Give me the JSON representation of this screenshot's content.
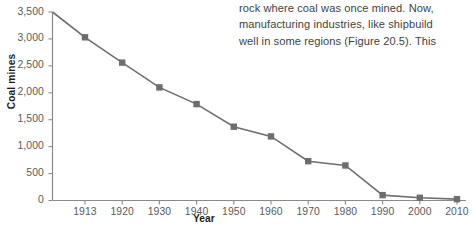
{
  "passage": {
    "lines": [
      "rock where coal was once mined. Now,",
      "manufacturing industries, like shipbuild",
      "well in some regions (Figure 20.5). This"
    ]
  },
  "chart_data": {
    "type": "line",
    "title": "",
    "xlabel": "Year",
    "ylabel": "Coal mines",
    "categories": [
      "1913",
      "1920",
      "1930",
      "1940",
      "1950",
      "1960",
      "1970",
      "1980",
      "1990",
      "2000",
      "2010"
    ],
    "values": [
      3030,
      2560,
      2100,
      1790,
      1370,
      1190,
      730,
      650,
      100,
      50,
      25
    ],
    "axis_origin_value": 3500,
    "ylim": [
      0,
      3500
    ],
    "yticks": [
      "0",
      "500",
      "1,000",
      "1,500",
      "2,000",
      "2,500",
      "3,000",
      "3,500"
    ],
    "ytick_values": [
      0,
      500,
      1000,
      1500,
      2000,
      2500,
      3000,
      3500
    ],
    "grid": false,
    "legend": "none",
    "marker": "square",
    "series_color": "#6e6e6e",
    "axis_color": "#8a8a8a"
  }
}
